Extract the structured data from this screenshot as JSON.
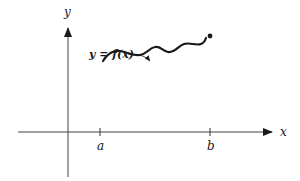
{
  "diagram": {
    "type": "function-graph",
    "axes": {
      "x_label": "x",
      "y_label": "y"
    },
    "ticks": [
      {
        "label": "a"
      },
      {
        "label": "b"
      }
    ],
    "curve_label": "y = f(x)",
    "colors": {
      "ink": "#1a1a1a",
      "axis": "#444444",
      "background": "#ffffff"
    }
  }
}
